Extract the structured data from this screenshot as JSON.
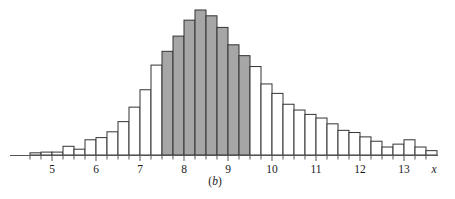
{
  "figure": {
    "caption_open": "(",
    "caption_letter": "b",
    "caption_close": ")",
    "caption_full": "(b)",
    "axis_label_x": "x",
    "background_color": "#ffffff",
    "bar_outline_color": "#333333",
    "bar_unshaded_fill": "#ffffff",
    "bar_shaded_fill": "#a6a6a6",
    "axis_color": "#555555"
  },
  "chart_data": {
    "type": "bar",
    "title": "",
    "subtitle": "",
    "xlabel": "x",
    "ylabel": "",
    "grid": false,
    "legend": null,
    "bin_width": 0.25,
    "xlim": [
      4.3,
      13.9
    ],
    "ylim": [
      0,
      1
    ],
    "tick_labels": [
      "5",
      "6",
      "7",
      "8",
      "9",
      "10",
      "11",
      "12",
      "13"
    ],
    "tick_values": [
      5,
      6,
      7,
      8,
      9,
      10,
      11,
      12,
      13
    ],
    "minor_tick_values": [
      4.5,
      4.75,
      5.25,
      5.5,
      5.75,
      6.25,
      6.5,
      6.75,
      7.25,
      7.5,
      7.75,
      8.25,
      8.5,
      8.75,
      9.25,
      9.5,
      9.75,
      10.25,
      10.5,
      10.75,
      11.25,
      11.5,
      11.75,
      12.25,
      12.5,
      12.75,
      13.25,
      13.5
    ],
    "highlight_range": [
      7.5,
      9.5
    ],
    "highlight_label": "shaded-bins",
    "categories": [
      "4.50",
      "4.75",
      "5.00",
      "5.25",
      "5.50",
      "5.75",
      "6.00",
      "6.25",
      "6.50",
      "6.75",
      "7.00",
      "7.25",
      "7.50",
      "7.75",
      "8.00",
      "8.25",
      "8.50",
      "8.75",
      "9.00",
      "9.25",
      "9.50",
      "9.75",
      "10.00",
      "10.25",
      "10.50",
      "10.75",
      "11.00",
      "11.25",
      "11.50",
      "11.75",
      "12.00",
      "12.25",
      "12.50",
      "12.75",
      "13.00",
      "13.25",
      "13.50"
    ],
    "bins": [
      {
        "x0": 4.5,
        "x1": 4.75,
        "value": 0.015,
        "shaded": false
      },
      {
        "x0": 4.75,
        "x1": 5.0,
        "value": 0.02,
        "shaded": false
      },
      {
        "x0": 5.0,
        "x1": 5.25,
        "value": 0.02,
        "shaded": false
      },
      {
        "x0": 5.25,
        "x1": 5.5,
        "value": 0.06,
        "shaded": false
      },
      {
        "x0": 5.5,
        "x1": 5.75,
        "value": 0.04,
        "shaded": false
      },
      {
        "x0": 5.75,
        "x1": 6.0,
        "value": 0.105,
        "shaded": false
      },
      {
        "x0": 6.0,
        "x1": 6.25,
        "value": 0.12,
        "shaded": false
      },
      {
        "x0": 6.25,
        "x1": 6.5,
        "value": 0.16,
        "shaded": false
      },
      {
        "x0": 6.5,
        "x1": 6.75,
        "value": 0.23,
        "shaded": false
      },
      {
        "x0": 6.75,
        "x1": 7.0,
        "value": 0.33,
        "shaded": false
      },
      {
        "x0": 7.0,
        "x1": 7.25,
        "value": 0.45,
        "shaded": false
      },
      {
        "x0": 7.25,
        "x1": 7.5,
        "value": 0.62,
        "shaded": false
      },
      {
        "x0": 7.5,
        "x1": 7.75,
        "value": 0.715,
        "shaded": true
      },
      {
        "x0": 7.75,
        "x1": 8.0,
        "value": 0.82,
        "shaded": true
      },
      {
        "x0": 8.0,
        "x1": 8.25,
        "value": 0.93,
        "shaded": true
      },
      {
        "x0": 8.25,
        "x1": 8.5,
        "value": 1.0,
        "shaded": true
      },
      {
        "x0": 8.5,
        "x1": 8.75,
        "value": 0.96,
        "shaded": true
      },
      {
        "x0": 8.75,
        "x1": 9.0,
        "value": 0.88,
        "shaded": true
      },
      {
        "x0": 9.0,
        "x1": 9.25,
        "value": 0.76,
        "shaded": true
      },
      {
        "x0": 9.25,
        "x1": 9.5,
        "value": 0.685,
        "shaded": true
      },
      {
        "x0": 9.5,
        "x1": 9.75,
        "value": 0.61,
        "shaded": false
      },
      {
        "x0": 9.75,
        "x1": 10.0,
        "value": 0.49,
        "shaded": false
      },
      {
        "x0": 10.0,
        "x1": 10.25,
        "value": 0.425,
        "shaded": false
      },
      {
        "x0": 10.25,
        "x1": 10.5,
        "value": 0.35,
        "shaded": false
      },
      {
        "x0": 10.5,
        "x1": 10.75,
        "value": 0.31,
        "shaded": false
      },
      {
        "x0": 10.75,
        "x1": 11.0,
        "value": 0.28,
        "shaded": false
      },
      {
        "x0": 11.0,
        "x1": 11.25,
        "value": 0.255,
        "shaded": false
      },
      {
        "x0": 11.25,
        "x1": 11.5,
        "value": 0.215,
        "shaded": false
      },
      {
        "x0": 11.5,
        "x1": 11.75,
        "value": 0.17,
        "shaded": false
      },
      {
        "x0": 11.75,
        "x1": 12.0,
        "value": 0.155,
        "shaded": false
      },
      {
        "x0": 12.0,
        "x1": 12.25,
        "value": 0.125,
        "shaded": false
      },
      {
        "x0": 12.25,
        "x1": 12.5,
        "value": 0.095,
        "shaded": false
      },
      {
        "x0": 12.5,
        "x1": 12.75,
        "value": 0.055,
        "shaded": false
      },
      {
        "x0": 12.75,
        "x1": 13.0,
        "value": 0.075,
        "shaded": false
      },
      {
        "x0": 13.0,
        "x1": 13.25,
        "value": 0.105,
        "shaded": false
      },
      {
        "x0": 13.25,
        "x1": 13.5,
        "value": 0.055,
        "shaded": false
      },
      {
        "x0": 13.5,
        "x1": 13.75,
        "value": 0.03,
        "shaded": false
      }
    ]
  }
}
